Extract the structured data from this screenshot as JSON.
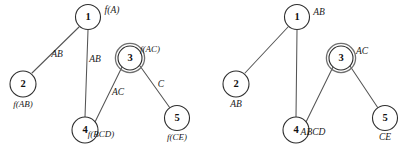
{
  "figure": {
    "width": 410,
    "height": 151,
    "background": "#ffffff",
    "line_color": "#555555",
    "node_stroke": "#2e2e2e",
    "accept_ring_color": "#6f6f6f"
  },
  "graphs": [
    {
      "id": "left-graph",
      "name": "junction-tree-with-f-labels",
      "nodes": [
        {
          "id": "n1",
          "label": "1",
          "cx": 88,
          "cy": 17,
          "r": 12.5,
          "double": false,
          "set_label": "f(A)",
          "set_x": 112,
          "set_y": 11,
          "set_anchor": "start"
        },
        {
          "id": "n2",
          "label": "2",
          "cx": 23,
          "cy": 84,
          "r": 13,
          "double": false,
          "set_label": "f(AB)",
          "set_x": 23,
          "set_y": 105,
          "set_anchor": "middle"
        },
        {
          "id": "n3",
          "label": "3",
          "cx": 130,
          "cy": 58,
          "r": 12,
          "double": true,
          "set_label": "f(AC)",
          "set_x": 150,
          "set_y": 50,
          "set_anchor": "start"
        },
        {
          "id": "n4",
          "label": "4",
          "cx": 85,
          "cy": 130,
          "r": 13,
          "double": false,
          "set_label": "f(BCD)",
          "set_x": 101,
          "set_y": 135,
          "set_anchor": "start"
        },
        {
          "id": "n5",
          "label": "5",
          "cx": 177,
          "cy": 118,
          "r": 12.5,
          "double": false,
          "set_label": "f(CE)",
          "set_x": 177,
          "set_y": 138,
          "set_anchor": "middle"
        }
      ],
      "edges": [
        {
          "id": "e1",
          "from": "n1",
          "to": "n2",
          "x1": 79,
          "y1": 27,
          "x2": 32,
          "y2": 73,
          "label": "AB",
          "lx": 57,
          "ly": 55
        },
        {
          "id": "e2",
          "from": "n1",
          "to": "n4",
          "x1": 88,
          "y1": 30,
          "x2": 85,
          "y2": 117,
          "label": "AB",
          "lx": 95,
          "ly": 60
        },
        {
          "id": "e3",
          "from": "n3",
          "to": "n4",
          "x1": 122,
          "y1": 67,
          "x2": 95,
          "y2": 122,
          "label": "AC",
          "lx": 118,
          "ly": 93
        },
        {
          "id": "e4",
          "from": "n3",
          "to": "n5",
          "x1": 140,
          "y1": 66,
          "x2": 170,
          "y2": 108,
          "label": "C",
          "lx": 161,
          "ly": 85
        }
      ]
    },
    {
      "id": "right-graph",
      "name": "junction-tree-with-set-labels",
      "nodes": [
        {
          "id": "n1",
          "label": "1",
          "cx": 297,
          "cy": 17,
          "r": 12.5,
          "double": false,
          "set_label": "AB",
          "set_x": 319,
          "set_y": 13,
          "set_anchor": "start"
        },
        {
          "id": "n2",
          "label": "2",
          "cx": 236,
          "cy": 84,
          "r": 13,
          "double": false,
          "set_label": "AB",
          "set_x": 236,
          "set_y": 105,
          "set_anchor": "middle"
        },
        {
          "id": "n3",
          "label": "3",
          "cx": 341,
          "cy": 58,
          "r": 12,
          "double": true,
          "set_label": "AC",
          "set_x": 362,
          "set_y": 52,
          "set_anchor": "start"
        },
        {
          "id": "n4",
          "label": "4",
          "cx": 296,
          "cy": 130,
          "r": 13,
          "double": false,
          "set_label": "ABCD",
          "set_x": 313,
          "set_y": 133,
          "set_anchor": "start"
        },
        {
          "id": "n5",
          "label": "5",
          "cx": 385,
          "cy": 118,
          "r": 12.5,
          "double": false,
          "set_label": "CE",
          "set_x": 385,
          "set_y": 138,
          "set_anchor": "middle"
        }
      ],
      "edges": [
        {
          "id": "e1",
          "from": "n1",
          "to": "n2",
          "x1": 288,
          "y1": 27,
          "x2": 245,
          "y2": 73,
          "label": "",
          "lx": 0,
          "ly": 0
        },
        {
          "id": "e2",
          "from": "n1",
          "to": "n4",
          "x1": 297,
          "y1": 30,
          "x2": 296,
          "y2": 117,
          "label": "",
          "lx": 0,
          "ly": 0
        },
        {
          "id": "e3",
          "from": "n3",
          "to": "n4",
          "x1": 333,
          "y1": 67,
          "x2": 306,
          "y2": 122,
          "label": "",
          "lx": 0,
          "ly": 0
        },
        {
          "id": "e4",
          "from": "n3",
          "to": "n5",
          "x1": 350,
          "y1": 66,
          "x2": 378,
          "y2": 108,
          "label": "",
          "lx": 0,
          "ly": 0
        }
      ]
    }
  ]
}
